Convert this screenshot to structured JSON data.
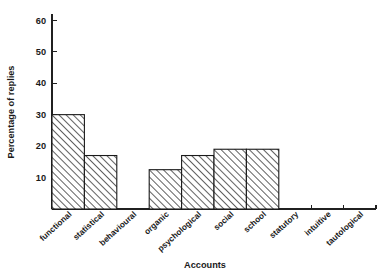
{
  "chart_data": {
    "type": "bar",
    "title": "",
    "xlabel": "Accounts",
    "ylabel": "Percentage of replies",
    "categories": [
      "functional",
      "statistical",
      "behavioural",
      "organic",
      "psychological",
      "social",
      "school",
      "statutory",
      "intuitive",
      "tautological"
    ],
    "values": [
      30,
      17,
      0,
      12.5,
      17,
      19,
      19,
      0,
      0,
      0
    ],
    "ylim": [
      0,
      62
    ],
    "yticks": [
      10,
      20,
      30,
      40,
      50,
      60
    ],
    "ytick_labels": [
      "10",
      "20",
      "30",
      "40",
      "50",
      "60"
    ],
    "grid": false,
    "legend": null,
    "bar_style": {
      "fill": "hatched-diagonal",
      "edge_color": "#1a1a1a",
      "hatch_color": "#2a2a2a",
      "background": "#ffffff"
    }
  },
  "figure": {
    "background_color": "#ffffff",
    "axis_color": "#202020"
  }
}
